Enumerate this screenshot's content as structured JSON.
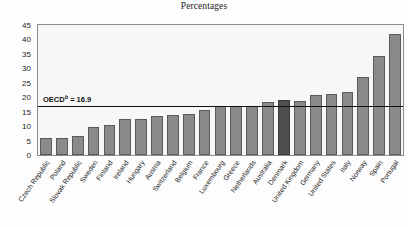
{
  "chart_data": {
    "type": "bar",
    "title": "Percentages",
    "xlabel": "",
    "ylabel": "",
    "ylim": [
      0,
      45
    ],
    "yticks": [
      0,
      5,
      10,
      15,
      20,
      25,
      30,
      35,
      40,
      45
    ],
    "grid": false,
    "legend": null,
    "categories": [
      "Czech Republic",
      "Poland",
      "Slovak Republic",
      "Sweden",
      "Finland",
      "Ireland",
      "Hungary",
      "Austria",
      "Switzerland",
      "Belgium",
      "France",
      "Luxembourg",
      "Greece",
      "Netherlands",
      "Australia",
      "Denmark",
      "United Kingdom",
      "Germany",
      "United States",
      "Italy",
      "Norway",
      "Spain",
      "Portugal"
    ],
    "values": [
      5.9,
      6.0,
      6.7,
      9.7,
      10.3,
      12.4,
      12.6,
      13.6,
      14.0,
      14.2,
      15.6,
      16.9,
      17.0,
      17.1,
      18.4,
      18.9,
      18.8,
      20.9,
      21.1,
      21.8,
      26.9,
      34.3,
      41.8
    ],
    "highlight_index": 15,
    "highlight_label": "Denmark",
    "bar_color": "#8a8a8a",
    "bar_edge_color": "#5a5a5a",
    "highlight_color": "#4e4e4e",
    "annotations": [
      {
        "name": "oecd-average-line",
        "text_prefix": "OECD",
        "text_superscript": "b",
        "text_suffix": " = 16.9",
        "value": 16.9,
        "line_color": "#111111"
      }
    ]
  }
}
